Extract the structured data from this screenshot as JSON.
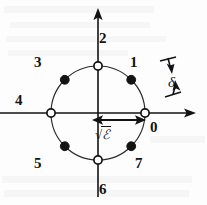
{
  "figure": {
    "type": "constellation-diagram",
    "background_color": "#fdfdfd",
    "stroke_color": "#131313",
    "geometry": {
      "center_x": 98,
      "center_y": 113,
      "radius": 47,
      "x_axis_start_x": 0,
      "x_axis_end_x": 196,
      "y_axis_top_y": 8,
      "y_axis_bottom_y": 197
    },
    "axes": {
      "x_axis_name": "in-phase-axis",
      "y_axis_name": "quadrature-axis",
      "x_arrowhead": "right",
      "y_arrowhead": "up"
    },
    "points": [
      {
        "label": "0",
        "angle_deg": 0,
        "marker": "open",
        "label_x": 150,
        "label_y": 120
      },
      {
        "label": "1",
        "angle_deg": 45,
        "marker": "filled",
        "label_x": 130,
        "label_y": 55
      },
      {
        "label": "2",
        "angle_deg": 90,
        "marker": "open",
        "label_x": 99,
        "label_y": 31
      },
      {
        "label": "3",
        "angle_deg": 135,
        "marker": "filled",
        "label_x": 34,
        "label_y": 55
      },
      {
        "label": "4",
        "angle_deg": 180,
        "marker": "open",
        "label_x": 15,
        "label_y": 93
      },
      {
        "label": "5",
        "angle_deg": 225,
        "marker": "filled",
        "label_x": 34,
        "label_y": 156
      },
      {
        "label": "6",
        "angle_deg": 270,
        "marker": "open",
        "label_x": 99,
        "label_y": 182
      },
      {
        "label": "7",
        "angle_deg": 315,
        "marker": "filled",
        "label_x": 135,
        "label_y": 156
      }
    ],
    "annotations": {
      "radius_label_prefix": "√",
      "radius_label_symbol": "ℰ",
      "radius_label_full": "√ℰ",
      "radius_label_x": 95,
      "radius_label_y": 128,
      "radius_arrow_name": "radius-double-arrow",
      "angle_label": "δ",
      "angle_label_x": 168,
      "angle_label_y": 75
    }
  }
}
